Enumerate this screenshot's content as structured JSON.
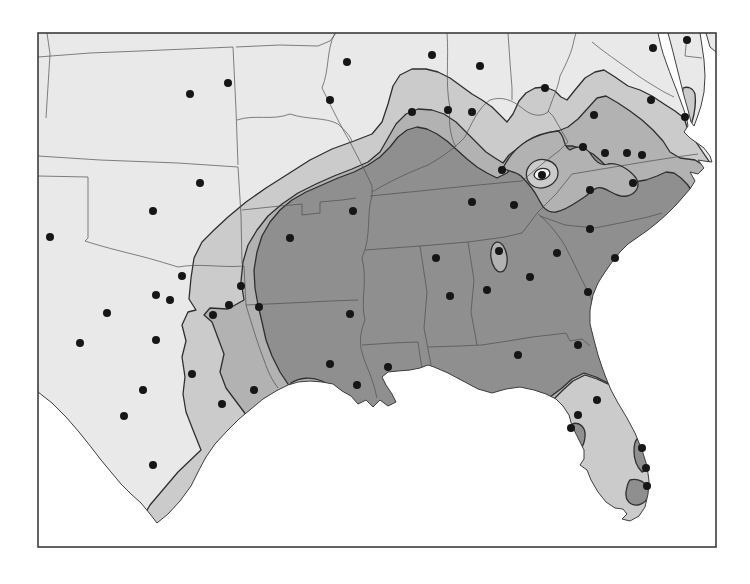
{
  "figure": {
    "kind": "shaded isopleth map",
    "area": "south-central and southeastern United States"
  },
  "frame": {
    "x": 38,
    "y": 33,
    "width": 678,
    "height": 514
  },
  "colors": {
    "page": "#fdfdfd",
    "water": "#ffffff",
    "band1": "#e9e9e9",
    "band2": "#cbcbcb",
    "band3": "#b2b2b2",
    "band4": "#8f8f8f",
    "eye_inner": "#f6f6f6",
    "contour": "#2f2f2f",
    "coast": "#3f3f3f",
    "state_line": "#4f4f4f",
    "frame": "#3c3c3c",
    "dot": "#161616"
  },
  "shading_levels": [
    {
      "name": "level-1-lightest",
      "color_key": "band1"
    },
    {
      "name": "level-2-light",
      "color_key": "band2"
    },
    {
      "name": "level-3-medium",
      "color_key": "band3"
    },
    {
      "name": "level-4-dark",
      "color_key": "band4"
    }
  ],
  "stations": {
    "count": 67,
    "radius": 4,
    "points": [
      [
        190,
        94
      ],
      [
        228,
        83
      ],
      [
        347,
        62
      ],
      [
        330,
        100
      ],
      [
        432,
        55
      ],
      [
        480,
        66
      ],
      [
        545,
        88
      ],
      [
        653,
        48
      ],
      [
        687,
        40
      ],
      [
        412,
        112
      ],
      [
        448,
        110
      ],
      [
        472,
        112
      ],
      [
        594,
        115
      ],
      [
        651,
        100
      ],
      [
        685,
        117
      ],
      [
        583,
        147
      ],
      [
        605,
        153
      ],
      [
        627,
        153
      ],
      [
        642,
        155
      ],
      [
        633,
        183
      ],
      [
        590,
        190
      ],
      [
        542,
        175
      ],
      [
        502,
        170
      ],
      [
        472,
        202
      ],
      [
        514,
        205
      ],
      [
        200,
        183
      ],
      [
        153,
        211
      ],
      [
        50,
        237
      ],
      [
        182,
        276
      ],
      [
        241,
        286
      ],
      [
        290,
        238
      ],
      [
        353,
        211
      ],
      [
        156,
        295
      ],
      [
        170,
        300
      ],
      [
        107,
        313
      ],
      [
        80,
        343
      ],
      [
        156,
        340
      ],
      [
        143,
        390
      ],
      [
        124,
        416
      ],
      [
        153,
        465
      ],
      [
        192,
        374
      ],
      [
        213,
        315
      ],
      [
        229,
        305
      ],
      [
        259,
        307
      ],
      [
        222,
        404
      ],
      [
        254,
        390
      ],
      [
        330,
        364
      ],
      [
        350,
        314
      ],
      [
        357,
        385
      ],
      [
        388,
        367
      ],
      [
        436,
        258
      ],
      [
        450,
        296
      ],
      [
        487,
        290
      ],
      [
        499,
        251
      ],
      [
        530,
        277
      ],
      [
        557,
        253
      ],
      [
        590,
        229
      ],
      [
        615,
        258
      ],
      [
        588,
        292
      ],
      [
        518,
        355
      ],
      [
        578,
        345
      ],
      [
        597,
        400
      ],
      [
        578,
        415
      ],
      [
        571,
        428
      ],
      [
        642,
        448
      ],
      [
        646,
        468
      ],
      [
        647,
        486
      ]
    ]
  }
}
